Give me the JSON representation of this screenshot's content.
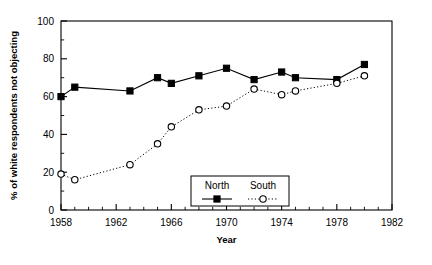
{
  "chart_data": {
    "type": "line",
    "title": "",
    "xlabel": "Year",
    "ylabel": "% of white respondents not objecting",
    "xlim": [
      1958,
      1982
    ],
    "ylim": [
      0,
      100
    ],
    "xticks": [
      1958,
      1962,
      1966,
      1970,
      1974,
      1978,
      1982
    ],
    "xtick_labels": [
      "1958",
      "1962",
      "1966",
      "1970",
      "1974",
      "1978",
      "1982"
    ],
    "yticks": [
      0,
      20,
      40,
      60,
      80,
      100
    ],
    "ytick_labels": [
      "0",
      "20",
      "40",
      "60",
      "80",
      "100"
    ],
    "minor_xtick_interval": 1,
    "minor_ytick_interval": 10,
    "grid": false,
    "legend_position": "lower-center",
    "series": [
      {
        "name": "North",
        "marker": "filled-square",
        "line_style": "solid",
        "color": "#000000",
        "x": [
          1958,
          1959,
          1963,
          1965,
          1966,
          1968,
          1970,
          1972,
          1974,
          1975,
          1978,
          1980
        ],
        "values": [
          60,
          65,
          63,
          70,
          67,
          71,
          75,
          69,
          73,
          70,
          69,
          77
        ]
      },
      {
        "name": "South",
        "marker": "open-circle",
        "line_style": "dotted",
        "color": "#000000",
        "x": [
          1958,
          1959,
          1963,
          1965,
          1966,
          1968,
          1970,
          1972,
          1974,
          1975,
          1978,
          1980
        ],
        "values": [
          19,
          16,
          24,
          35,
          44,
          53,
          55,
          64,
          61,
          63,
          67,
          71
        ]
      }
    ]
  },
  "legend": {
    "entries": [
      {
        "label": "North"
      },
      {
        "label": "South"
      }
    ]
  },
  "axes": {
    "x_title": "Year",
    "y_title": "% of white respondents not objecting"
  }
}
